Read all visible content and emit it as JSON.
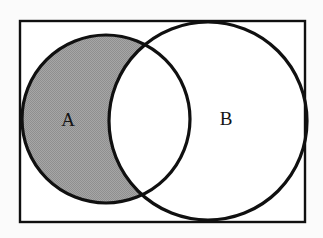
{
  "figure": {
    "kind": "venn-diagram",
    "background_color": "#fbfbfb",
    "stroke_color": "#101010",
    "shade_color": "#9e9e9e",
    "unshaded_color": "#ffffff"
  },
  "universe": {
    "name": "universal-set-rectangle",
    "x": 20,
    "y": 21,
    "width": 285,
    "height": 201,
    "stroke_width": 2.4,
    "fill": "#ffffff"
  },
  "sets": [
    {
      "name": "set-a",
      "label": "A",
      "cx": 106,
      "cy": 119,
      "r": 84,
      "stroke_width": 3.2,
      "label_x": 68,
      "label_y": 122,
      "shaded": true
    },
    {
      "name": "set-b",
      "label": "B",
      "cx": 208,
      "cy": 121,
      "r": 99,
      "stroke_width": 3.2,
      "label_x": 226,
      "label_y": 121,
      "shaded": false
    }
  ],
  "regions": {
    "a_only": {
      "name": "region-a-minus-b",
      "fill": "#9e9e9e",
      "shaded": true
    },
    "intersection": {
      "name": "region-a-intersect-b",
      "fill": "#ffffff",
      "shaded": false
    },
    "b_only": {
      "name": "region-b-minus-a",
      "fill": "#ffffff",
      "shaded": false
    },
    "outside": {
      "name": "region-outside-sets",
      "fill": "#ffffff",
      "shaded": false
    }
  }
}
